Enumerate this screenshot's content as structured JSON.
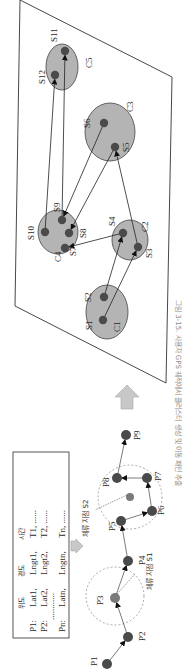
{
  "figure": {
    "caption": "그림 3-15. 사용자 GPS 궤적에서 클러스터 생성 및 이동 패턴 추출",
    "orientation": "rotated 90° counter-clockwise"
  },
  "table": {
    "headers": [
      "",
      "위도",
      "경도",
      "시간"
    ],
    "rows": [
      [
        "P1:",
        "Lat1,",
        "Lngt1,",
        "T1, ......"
      ],
      [
        "P2:",
        "Lat2,",
        "Lngt2,",
        "T2, ......"
      ],
      [
        "",
        "............",
        "",
        ""
      ],
      [
        "Pn:",
        "Latn,",
        "Lngtn,",
        "Tn, ......"
      ]
    ]
  },
  "trajectory": {
    "points": [
      "P1",
      "P2",
      "P3",
      "P4",
      "P5",
      "P6",
      "P7",
      "P8",
      "P9"
    ],
    "stay_points": [
      {
        "label": "체류 지점 S1",
        "members": [
          "P3"
        ]
      },
      {
        "label": "체류 지점 S2",
        "members": [
          "P5",
          "P6",
          "P7",
          "P8"
        ]
      }
    ]
  },
  "clusters": [
    {
      "name": "C1",
      "stays": [
        "S1",
        "S2"
      ]
    },
    {
      "name": "C2",
      "stays": [
        "S3",
        "S4"
      ]
    },
    {
      "name": "C3",
      "stays": [
        "S5",
        "S6"
      ]
    },
    {
      "name": "C4",
      "stays": [
        "S7",
        "S8",
        "S9",
        "S10"
      ]
    },
    {
      "name": "C5",
      "stays": [
        "S11",
        "S12"
      ]
    }
  ],
  "transitions": [
    [
      "S1",
      "S3"
    ],
    [
      "S2",
      "S4"
    ],
    [
      "S4",
      "S7"
    ],
    [
      "S3",
      "S5"
    ],
    [
      "S5",
      "S8"
    ],
    [
      "S6",
      "S9"
    ],
    [
      "S10",
      "S12"
    ],
    [
      "S9",
      "S11"
    ]
  ],
  "colors": {
    "cluster_fill": "#b4b4b4",
    "cluster_stroke": "#555555",
    "dot": "#4a4a4a",
    "stay_dot": "#7a7a7a",
    "arrow_fill": "#c8c8c8"
  }
}
